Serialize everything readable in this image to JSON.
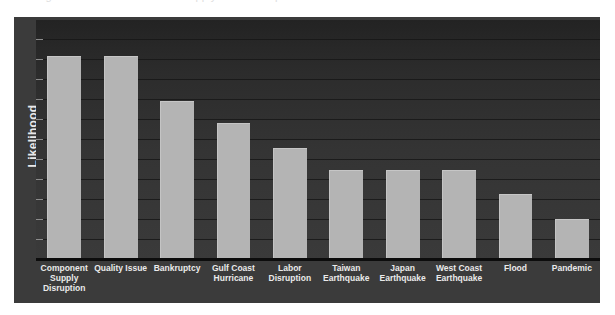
{
  "caption": {
    "text": "Figure: Relative likelihood of supply chain disruption events"
  },
  "chart_data": {
    "type": "bar",
    "title": "",
    "xlabel": "",
    "ylabel": "Likelihood",
    "categories": [
      "Component Supply Disruption",
      "Quality Issue",
      "Bankruptcy",
      "Gulf Coast Hurricane",
      "Labor Disruption",
      "Taiwan Earthquake",
      "Japan Earthquake",
      "West Coast Earthquake",
      "Flood",
      "Pandemic"
    ],
    "values": [
      100,
      100,
      78,
      67,
      55,
      44,
      44,
      44,
      32,
      20
    ],
    "ylim": [
      0,
      118
    ],
    "grid": true,
    "gridline_count": 12,
    "legend": "none",
    "orientation": "vertical",
    "axis_tick_labels": [],
    "colors": {
      "bar": "#b4b4b4",
      "plot_background": "#2e2e2e",
      "panel_background": "#3b3b3b",
      "gridline": "#171717",
      "axis_line": "#0c0c0c",
      "label_text": "#eaeaea"
    }
  }
}
